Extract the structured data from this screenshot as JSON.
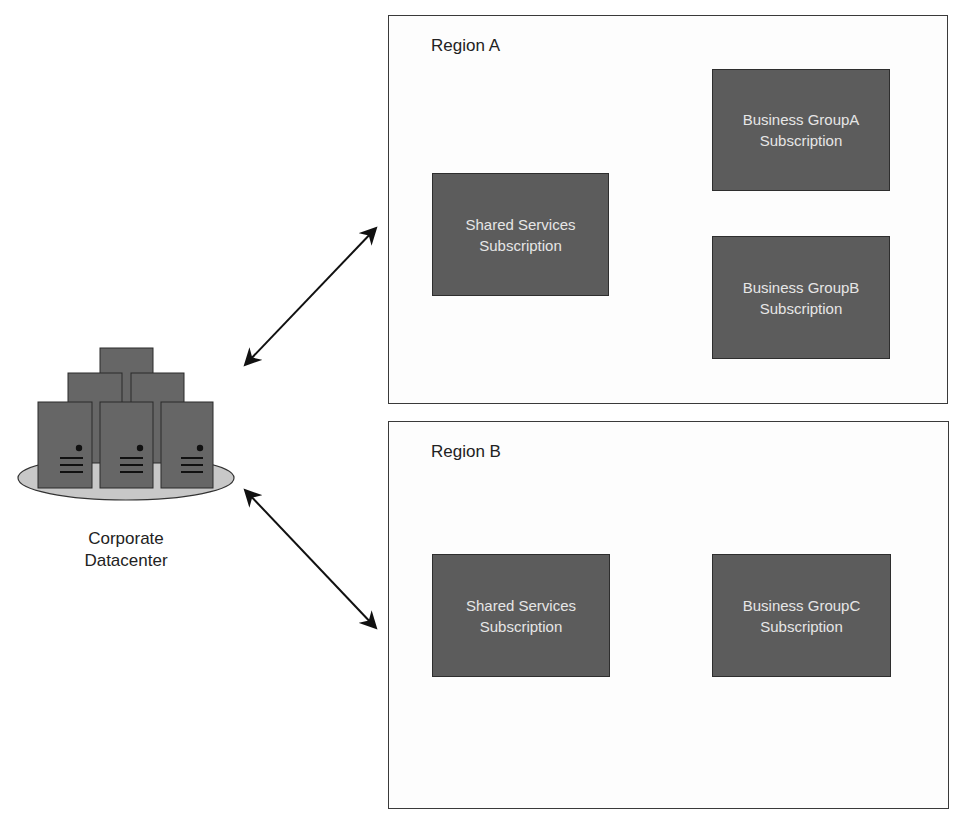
{
  "diagram": {
    "datacenter": {
      "label_line1": "Corporate",
      "label_line2": "Datacenter",
      "icon": "server-cluster-icon"
    },
    "regions": [
      {
        "title": "Region A",
        "subscriptions": [
          {
            "line1": "Shared Services",
            "line2": "Subscription"
          },
          {
            "line1": "Business GroupA",
            "line2": "Subscription"
          },
          {
            "line1": "Business GroupB",
            "line2": "Subscription"
          }
        ]
      },
      {
        "title": "Region B",
        "subscriptions": [
          {
            "line1": "Shared Services",
            "line2": "Subscription"
          },
          {
            "line1": "Business GroupC",
            "line2": "Subscription"
          }
        ]
      }
    ],
    "connections": [
      {
        "from": "Corporate Datacenter",
        "to": "Region A",
        "type": "bidirectional-arrow"
      },
      {
        "from": "Corporate Datacenter",
        "to": "Region B",
        "type": "bidirectional-arrow"
      }
    ],
    "colors": {
      "subscription_fill": "#5c5c5c",
      "subscription_text": "#e6e6e6",
      "server_fill": "#666666",
      "platform_fill": "#c8c8c8",
      "border": "#3a3a3a"
    }
  }
}
